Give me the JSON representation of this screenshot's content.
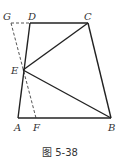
{
  "figure": {
    "caption": "图 5-38",
    "line_color": "#222222",
    "dashed_color": "#555555",
    "points": {
      "G": {
        "label": "G",
        "x": 11,
        "y": 23
      },
      "D": {
        "label": "D",
        "x": 30,
        "y": 23
      },
      "C": {
        "label": "C",
        "x": 88,
        "y": 23
      },
      "E": {
        "label": "E",
        "x": 23,
        "y": 70
      },
      "A": {
        "label": "A",
        "x": 18,
        "y": 118
      },
      "F": {
        "label": "F",
        "x": 36,
        "y": 118
      },
      "B": {
        "label": "B",
        "x": 111,
        "y": 118
      }
    },
    "solid_segments": [
      [
        "A",
        "B"
      ],
      [
        "B",
        "C"
      ],
      [
        "C",
        "D"
      ],
      [
        "D",
        "A"
      ],
      [
        "E",
        "C"
      ],
      [
        "E",
        "B"
      ]
    ],
    "dashed_segments": [
      [
        "G",
        "D"
      ],
      [
        "G",
        "F"
      ]
    ]
  }
}
